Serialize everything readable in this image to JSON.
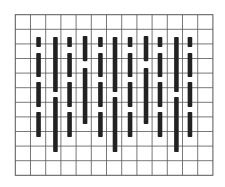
{
  "figure": {
    "grid": {
      "columns": 13,
      "rows": 11,
      "line_color": "#555555",
      "background": "#ffffff"
    },
    "bar_color": "#222222",
    "patterns": {
      "short": [
        [
          1.53,
          2.21
        ],
        [
          2.62,
          4.27
        ],
        [
          4.61,
          6.32
        ],
        [
          6.66,
          8.38
        ]
      ],
      "long": [
        [
          1.53,
          5.29
        ],
        [
          5.64,
          9.4
        ]
      ],
      "medium": [
        [
          1.46,
          3.18
        ],
        [
          3.65,
          7.49
        ]
      ]
    },
    "bars": [
      {
        "col": 1.53,
        "pattern": "short"
      },
      {
        "col": 2.64,
        "pattern": "long"
      },
      {
        "col": 3.57,
        "pattern": "short"
      },
      {
        "col": 4.59,
        "pattern": "medium"
      },
      {
        "col": 5.6,
        "pattern": "short"
      },
      {
        "col": 6.56,
        "pattern": "long"
      },
      {
        "col": 7.55,
        "pattern": "short"
      },
      {
        "col": 8.6,
        "pattern": "medium"
      },
      {
        "col": 9.52,
        "pattern": "short"
      },
      {
        "col": 10.6,
        "pattern": "long"
      },
      {
        "col": 11.49,
        "pattern": "short"
      }
    ]
  }
}
